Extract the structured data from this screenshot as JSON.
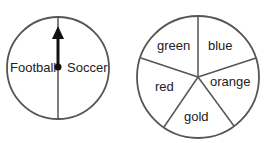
{
  "spinners": [
    {
      "id": "sport-spinner",
      "sections": [
        {
          "label": "Football"
        },
        {
          "label": "Soccer"
        }
      ],
      "has_arrow": true,
      "arrow_direction": "up"
    },
    {
      "id": "color-spinner",
      "sections": [
        {
          "label": "green"
        },
        {
          "label": "blue"
        },
        {
          "label": "orange"
        },
        {
          "label": "gold"
        },
        {
          "label": "red"
        }
      ]
    }
  ],
  "colors": {
    "stroke": "#555555",
    "arrow": "#111111",
    "text": "#222222"
  }
}
